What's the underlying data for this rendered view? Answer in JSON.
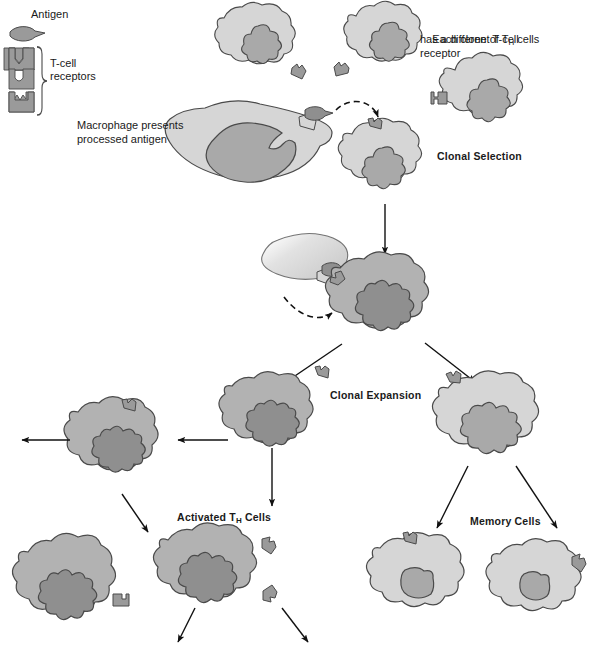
{
  "figure": {
    "title_cutoff": "",
    "legend": {
      "antigen_label": "Antigen",
      "receptor_label_line1": "T-cell",
      "receptor_label_line2": "receptors",
      "receptor_count": 4
    },
    "annotations": {
      "clone_note": "Each clone of Tₕ cells\nhas a different T-cell\nreceptor",
      "clone_note_l1_a": "Each clone of T",
      "clone_note_l1_sub": "H",
      "clone_note_l1_b": " cells",
      "clone_note_l2": "has a different T-cell",
      "clone_note_l3": "receptor",
      "macrophage_l1": "Macrophage presents",
      "macrophage_l2": "processed antigen",
      "clonal_selection": "Clonal Selection",
      "clonal_expansion": "Clonal Expansion",
      "activated_a": "Activated T",
      "activated_sub": "H",
      "activated_b": " Cells",
      "memory_cells": "Memory Cells"
    },
    "colors": {
      "cell_light": "#d6d6d6",
      "cell_mid": "#b2b2b2",
      "nucleus_light": "#a9a9a9",
      "nucleus_mid": "#8f8f8f",
      "outline": "#4a4a4a",
      "text": "#1a1a1a",
      "background": "#ffffff",
      "arrow": "#111111"
    },
    "cells": [
      {
        "name": "naive-t-cell-1",
        "type": "light",
        "label": "",
        "receptor": "notch"
      },
      {
        "name": "naive-t-cell-2",
        "type": "light",
        "label": "",
        "receptor": "notch"
      },
      {
        "name": "naive-t-cell-3",
        "type": "light",
        "label": "",
        "receptor": "square"
      },
      {
        "name": "selected-t-cell",
        "type": "light",
        "label": "",
        "receptor": "match"
      },
      {
        "name": "macrophage",
        "type": "light",
        "label": "Macrophage presents processed antigen",
        "receptor": "antigen"
      },
      {
        "name": "activated-blast-cell",
        "type": "mid",
        "label": "Clonal Expansion",
        "receptor": "match"
      },
      {
        "name": "activated-th-cell-1",
        "type": "mid",
        "label": "Activated TH Cells",
        "receptor": "match"
      },
      {
        "name": "activated-th-cell-2",
        "type": "mid",
        "label": "",
        "receptor": "match"
      },
      {
        "name": "activated-th-cell-3",
        "type": "mid",
        "label": "",
        "receptor": "match"
      },
      {
        "name": "activated-th-cell-4",
        "type": "mid",
        "label": "",
        "receptor": "match"
      },
      {
        "name": "memory-parent-cell",
        "type": "light",
        "label": "",
        "receptor": "match"
      },
      {
        "name": "memory-cell-1",
        "type": "light",
        "label": "Memory Cells",
        "receptor": "match"
      },
      {
        "name": "memory-cell-2",
        "type": "light",
        "label": "",
        "receptor": "match"
      }
    ]
  }
}
